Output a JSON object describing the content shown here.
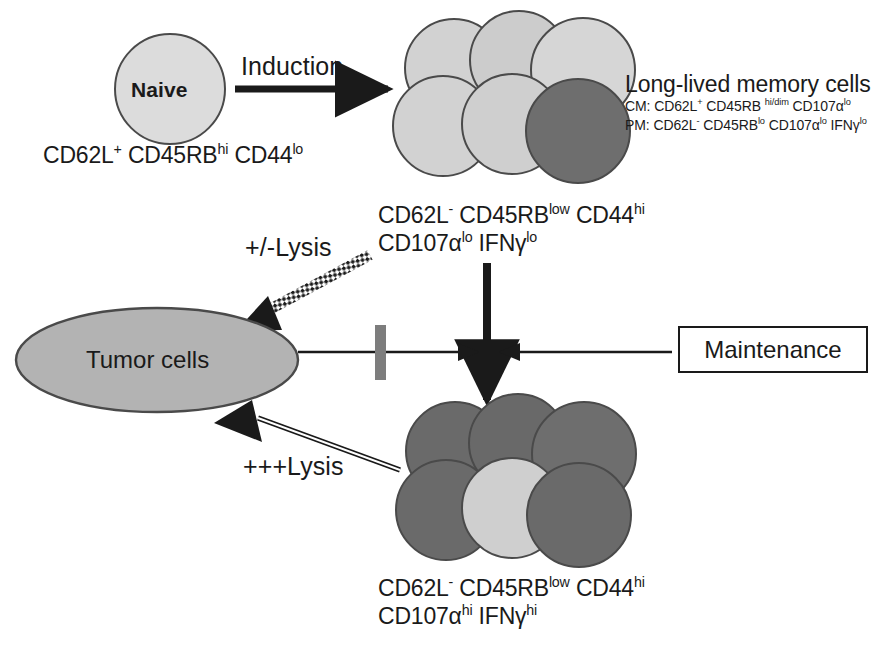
{
  "figure": {
    "background_color": "#ffffff"
  },
  "colors": {
    "cell_light": "#d4d4d4",
    "cell_dark": "#6e6e6e",
    "tumor_fill": "#b3b3b3",
    "stroke": "#4a4a4a",
    "ink": "#1a1a1a",
    "blocker_gray": "#7d7d7d"
  },
  "naive_cell": {
    "label": "Naive",
    "markers": {
      "prefix1": "CD62L",
      "sup1": "+",
      "prefix2": " CD45RB",
      "sup2": "hi",
      "prefix3": " CD44",
      "sup3": "lo"
    }
  },
  "induction": {
    "label": "Induction"
  },
  "memory_cells": {
    "title": "Long-lived memory cells",
    "subtitle_cm": {
      "p1": "CM: CD62L",
      "s1": "+",
      "p2": " CD45RB ",
      "s2": "hi/dim",
      "p3": " CD107α",
      "s3": "lo"
    },
    "subtitle_pm": {
      "p1": "PM: CD62L",
      "s1": "-",
      "p2": " CD45RB",
      "s2": "lo",
      "p3": " CD107α",
      "s3": "lo",
      "p4": " IFNγ",
      "s4": "lo"
    },
    "markers_line1": {
      "p1": "CD62L",
      "s1": "-",
      "p2": " CD45RB",
      "s2": "low",
      "p3": " CD44",
      "s3": "hi"
    },
    "markers_line2": {
      "p1": "CD107α",
      "s1": "lo",
      "p2": " IFNγ",
      "s2": "lo"
    },
    "cluster_counts": {
      "light": 5,
      "dark": 1,
      "total": 6
    }
  },
  "effector_cells": {
    "markers_line1": {
      "p1": "CD62L",
      "s1": "-",
      "p2": " CD45RB",
      "s2": "low",
      "p3": " CD44",
      "s3": "hi"
    },
    "markers_line2": {
      "p1": "CD107α",
      "s1": "hi",
      "p2": " IFNγ",
      "s2": "hi"
    },
    "cluster_counts": {
      "light": 1,
      "dark": 5,
      "total": 6
    }
  },
  "tumor": {
    "label": "Tumor cells"
  },
  "maintenance": {
    "label": "Maintenance"
  },
  "lysis_weak": {
    "label": "+/-Lysis",
    "arrow_style": "dotted-hatched",
    "direction": "memory-to-tumor"
  },
  "lysis_strong": {
    "label": "+++Lysis",
    "arrow_style": "double-line-open",
    "direction": "effector-to-tumor"
  },
  "connectors": {
    "induction_arrow": "naive-to-memory",
    "differentiation_arrow": "memory-to-effector",
    "tumor_to_junction": "tumor-cells-to-junction",
    "maintenance_to_junction": "maintenance-to-junction",
    "blocker": "inhibition-bar"
  }
}
